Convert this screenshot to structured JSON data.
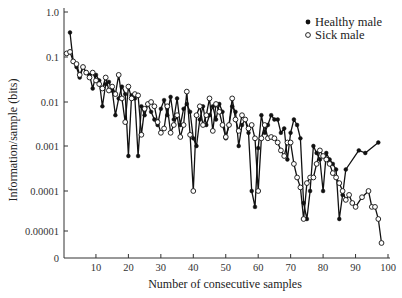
{
  "chart_data": {
    "type": "line",
    "title": "",
    "xlabel": "Number of consecutive samples",
    "ylabel": "Information/sample (bits)",
    "yscale": "log",
    "xlim": [
      0,
      100
    ],
    "ylim": [
      0,
      1.0
    ],
    "grid": false,
    "legend_position": "upper right",
    "x_ticks": [
      10,
      20,
      30,
      40,
      50,
      60,
      70,
      80,
      90,
      100
    ],
    "x_tick_labels": [
      "10",
      "20",
      "30",
      "40",
      "50",
      "60",
      "70",
      "80",
      "90",
      "100"
    ],
    "y_ticks": [
      1.0,
      0.1,
      0.01,
      0.001,
      0.0001,
      1e-05,
      0
    ],
    "y_tick_labels": [
      "1.0",
      "0.1",
      "0.01",
      "0.001",
      "0.0001",
      "0.00001",
      "0"
    ],
    "series": [
      {
        "name": "Healthy male",
        "marker": "filled-circle",
        "color": "#111111",
        "x": [
          2,
          3,
          4,
          5,
          6,
          7,
          8,
          9,
          10,
          11,
          12,
          13,
          14,
          15,
          16,
          17,
          18,
          19,
          20,
          21,
          22,
          23,
          24,
          25,
          26,
          27,
          28,
          29,
          30,
          31,
          32,
          33,
          34,
          35,
          36,
          37,
          38,
          39,
          40,
          41,
          42,
          43,
          44,
          45,
          46,
          47,
          48,
          49,
          50,
          51,
          52,
          53,
          54,
          55,
          56,
          57,
          58,
          59,
          60,
          61,
          62,
          63,
          64,
          65,
          66,
          67,
          68,
          69,
          70,
          71,
          72,
          73,
          74,
          75,
          76,
          77,
          78,
          79,
          80,
          81,
          82,
          83,
          84,
          85,
          86,
          87,
          91,
          93,
          97
        ],
        "values": [
          0.35,
          0.08,
          0.06,
          0.035,
          0.06,
          0.045,
          0.04,
          0.02,
          0.04,
          0.03,
          0.008,
          0.025,
          0.028,
          0.018,
          0.005,
          0.012,
          0.022,
          0.015,
          0.0006,
          0.014,
          0.012,
          0.0006,
          0.008,
          0.005,
          0.009,
          0.006,
          0.004,
          0.003,
          0.007,
          0.011,
          0.005,
          0.013,
          0.004,
          0.012,
          0.003,
          0.007,
          0.009,
          0.006,
          0.0015,
          0.001,
          0.004,
          0.008,
          0.003,
          0.005,
          0.008,
          0.004,
          0.009,
          0.006,
          0.0015,
          0.003,
          0.008,
          0.006,
          0.001,
          0.003,
          0.004,
          0.002,
          0.0001,
          4e-05,
          0.0009,
          0.005,
          0.002,
          0.003,
          0.005,
          0.004,
          0.004,
          0.002,
          0.0025,
          0.0005,
          0.002,
          0.004,
          0.003,
          0.0015,
          5e-05,
          2e-05,
          0.0001,
          0.001,
          0.0007,
          0.0005,
          0.0001,
          0.0007,
          0.0005,
          0.0004,
          0.0003,
          2e-05,
          8e-05,
          0.0003,
          0.0008,
          0.0007,
          0.0012
        ]
      },
      {
        "name": "Sick male",
        "marker": "open-circle",
        "color": "#111111",
        "x": [
          1,
          2,
          3,
          4,
          5,
          6,
          7,
          8,
          9,
          10,
          11,
          12,
          13,
          14,
          15,
          16,
          17,
          18,
          19,
          20,
          21,
          22,
          23,
          24,
          25,
          26,
          27,
          28,
          29,
          30,
          31,
          32,
          33,
          34,
          35,
          36,
          37,
          38,
          39,
          40,
          41,
          42,
          43,
          44,
          45,
          46,
          47,
          48,
          49,
          50,
          51,
          52,
          53,
          54,
          55,
          56,
          57,
          58,
          59,
          60,
          61,
          62,
          63,
          64,
          65,
          66,
          67,
          68,
          69,
          70,
          71,
          72,
          73,
          74,
          75,
          76,
          77,
          78,
          79,
          80,
          81,
          82,
          83,
          84,
          85,
          86,
          87,
          88,
          89,
          90,
          92,
          94,
          95,
          96,
          97,
          98
        ],
        "values": [
          0.12,
          0.13,
          0.08,
          0.07,
          0.04,
          0.06,
          0.045,
          0.035,
          0.045,
          0.03,
          0.025,
          0.02,
          0.035,
          0.018,
          0.022,
          0.015,
          0.04,
          0.012,
          0.0035,
          0.022,
          0.012,
          0.015,
          0.014,
          0.0018,
          0.007,
          0.009,
          0.01,
          0.008,
          0.0035,
          0.002,
          0.0025,
          0.008,
          0.002,
          0.003,
          0.005,
          0.0016,
          0.003,
          0.017,
          0.0018,
          0.0001,
          0.005,
          0.008,
          0.003,
          0.005,
          0.012,
          0.0022,
          0.009,
          0.006,
          0.003,
          0.0016,
          0.003,
          0.012,
          0.004,
          0.0022,
          0.005,
          0.004,
          0.0025,
          0.003,
          0.0015,
          0.0001,
          0.0015,
          0.003,
          0.0015,
          0.0016,
          0.0015,
          0.0012,
          0.0008,
          0.0006,
          0.0012,
          0.0012,
          0.0004,
          0.0002,
          0.00012,
          2e-05,
          0.00015,
          0.0002,
          0.0002,
          0.0004,
          0.0008,
          0.0006,
          0.0005,
          0.0004,
          0.00025,
          0.0002,
          0.00015,
          0.0001,
          6e-05,
          8e-05,
          5e-05,
          4e-05,
          7e-05,
          0.0001,
          4e-05,
          4e-05,
          2e-05,
          5e-06
        ]
      }
    ]
  },
  "legend": {
    "items": [
      {
        "label": "Healthy male",
        "marker": "filled-circle"
      },
      {
        "label": "Sick male",
        "marker": "open-circle"
      }
    ]
  }
}
